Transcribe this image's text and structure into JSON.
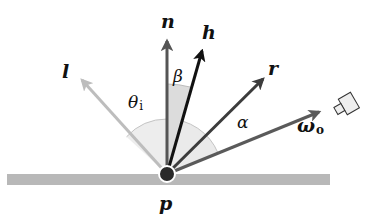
{
  "diagram": {
    "colors": {
      "background": "#ffffff",
      "surface": "#b8b8b8",
      "point": "#2a2a2a",
      "n_vector": "#555555",
      "h_vector": "#111111",
      "l_vector": "#bdbdbd",
      "r_vector": "#3c3c3c",
      "omega_vector": "#5a5a5a",
      "theta_wedge": "#ececec",
      "beta_wedge": "#d9d9d9",
      "alpha_wedge": "#e8e8e8",
      "arc_stroke": "#c4c4c4",
      "camera_fill": "#eeeeee",
      "camera_stroke": "#333333"
    },
    "origin": {
      "x": 167,
      "y": 174
    },
    "vectors": [
      {
        "id": "n",
        "label": "n",
        "role": "surface normal",
        "end": {
          "x": 167,
          "y": 38
        }
      },
      {
        "id": "h",
        "label": "h",
        "role": "half vector",
        "end": {
          "x": 203,
          "y": 48
        }
      },
      {
        "id": "l",
        "label": "l",
        "role": "light direction",
        "end": {
          "x": 80,
          "y": 78
        }
      },
      {
        "id": "r",
        "label": "r",
        "role": "reflected direction",
        "end": {
          "x": 265,
          "y": 77
        }
      },
      {
        "id": "omega_o",
        "label": "ω",
        "subscript": "o",
        "role": "outgoing / view direction",
        "end": {
          "x": 322,
          "y": 110
        }
      }
    ],
    "angles": [
      {
        "id": "theta_i",
        "symbol": "θ",
        "subscript": "i",
        "between": [
          "l",
          "n"
        ]
      },
      {
        "id": "beta",
        "symbol": "β",
        "between": [
          "n",
          "h"
        ]
      },
      {
        "id": "alpha",
        "symbol": "α",
        "between": [
          "r",
          "omega_o"
        ]
      }
    ],
    "point_label": "p",
    "surface_label": "",
    "camera_icon": "camera-icon"
  }
}
